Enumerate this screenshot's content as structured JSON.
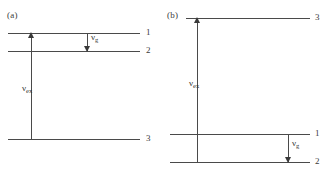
{
  "figure": {
    "width": 325,
    "height": 173,
    "background": "#ffffff",
    "line_color": "#4a4a4a",
    "text_color": "#3a3a3a"
  },
  "panels": [
    {
      "id": "a",
      "label": "(a)",
      "levels": [
        {
          "id": "a-level-1",
          "number": "1"
        },
        {
          "id": "a-level-2",
          "number": "2"
        },
        {
          "id": "a-level-3",
          "number": "3"
        }
      ],
      "transitions": [
        {
          "id": "a-excitation",
          "symbol": "ν",
          "subscript": "ex",
          "direction": "up",
          "from_level": "3",
          "to_level": "1"
        },
        {
          "id": "a-emission",
          "symbol": "ν",
          "subscript": "g",
          "direction": "down",
          "from_level": "1",
          "to_level": "2"
        }
      ]
    },
    {
      "id": "b",
      "label": "(b)",
      "levels": [
        {
          "id": "b-level-3",
          "number": "3"
        },
        {
          "id": "b-level-1",
          "number": "1"
        },
        {
          "id": "b-level-2",
          "number": "2"
        }
      ],
      "transitions": [
        {
          "id": "b-excitation",
          "symbol": "ν",
          "subscript": "ex",
          "direction": "up",
          "from_level": "2",
          "to_level": "3"
        },
        {
          "id": "b-emission",
          "symbol": "ν",
          "subscript": "g",
          "direction": "down",
          "from_level": "1",
          "to_level": "2"
        }
      ]
    }
  ]
}
